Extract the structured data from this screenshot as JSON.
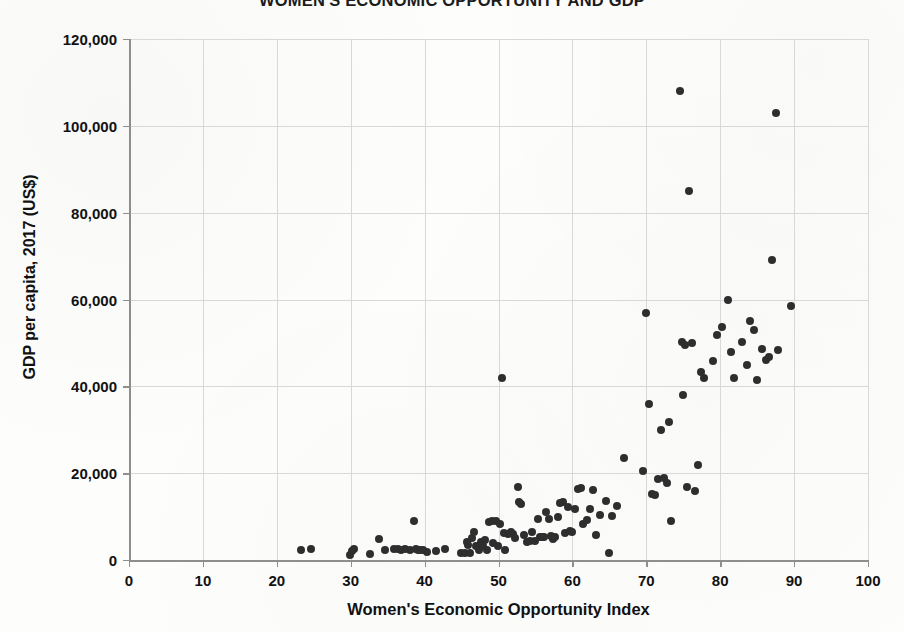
{
  "chart_data": {
    "type": "scatter",
    "title": "WOMEN'S ECONOMIC OPPORTUNITY AND GDP",
    "xlabel": "Women's Economic Opportunity Index",
    "ylabel": "GDP per capita, 2017 (US$)",
    "xlim": [
      0,
      100
    ],
    "ylim": [
      0,
      120000
    ],
    "xticks": [
      "0",
      "10",
      "20",
      "30",
      "40",
      "50",
      "60",
      "70",
      "80",
      "90",
      "100"
    ],
    "xtick_values": [
      0,
      10,
      20,
      30,
      40,
      50,
      60,
      70,
      80,
      90,
      100
    ],
    "yticks": [
      "0",
      "20,000",
      "40,000",
      "60,000",
      "80,000",
      "100,000",
      "120,000"
    ],
    "ytick_values": [
      0,
      20000,
      40000,
      60000,
      80000,
      100000,
      120000
    ],
    "grid": "both",
    "legend": "none",
    "marker_color": "#2e2e2e",
    "marker_size_px": 8,
    "gridline_color": "#d8d8d8",
    "axis_color": "#8e8e8e",
    "background_color": "#fdfdfc",
    "points": [
      [
        23.3,
        2300
      ],
      [
        24.6,
        2500
      ],
      [
        29.9,
        1200
      ],
      [
        30.2,
        2000
      ],
      [
        30.4,
        2600
      ],
      [
        32.6,
        1300
      ],
      [
        33.8,
        4800
      ],
      [
        34.6,
        2300
      ],
      [
        35.8,
        2500
      ],
      [
        36.4,
        2600
      ],
      [
        36.8,
        2400
      ],
      [
        37.4,
        2500
      ],
      [
        38.0,
        2200
      ],
      [
        38.6,
        9000
      ],
      [
        38.9,
        2600
      ],
      [
        39.1,
        2300
      ],
      [
        39.4,
        2200
      ],
      [
        39.8,
        2400
      ],
      [
        40.3,
        1800
      ],
      [
        41.5,
        2100
      ],
      [
        42.8,
        2600
      ],
      [
        44.9,
        1500
      ],
      [
        45.4,
        1600
      ],
      [
        45.7,
        4200
      ],
      [
        45.9,
        3400
      ],
      [
        46.2,
        1700
      ],
      [
        46.4,
        5000
      ],
      [
        46.7,
        6500
      ],
      [
        46.9,
        3300
      ],
      [
        47.3,
        2200
      ],
      [
        47.6,
        4100
      ],
      [
        47.9,
        3300
      ],
      [
        48.2,
        4500
      ],
      [
        48.4,
        2400
      ],
      [
        48.7,
        8700
      ],
      [
        49.1,
        9000
      ],
      [
        49.3,
        4000
      ],
      [
        49.6,
        8900
      ],
      [
        49.9,
        3300
      ],
      [
        50.2,
        8300
      ],
      [
        50.5,
        42000
      ],
      [
        50.7,
        6200
      ],
      [
        50.9,
        2400
      ],
      [
        51.3,
        5900
      ],
      [
        51.7,
        6500
      ],
      [
        52.0,
        6100
      ],
      [
        52.3,
        5100
      ],
      [
        52.6,
        16700
      ],
      [
        52.8,
        13300
      ],
      [
        53.1,
        12900
      ],
      [
        53.4,
        5800
      ],
      [
        53.8,
        4200
      ],
      [
        54.2,
        4400
      ],
      [
        54.6,
        6500
      ],
      [
        55.0,
        4300
      ],
      [
        55.3,
        9400
      ],
      [
        55.6,
        5300
      ],
      [
        55.9,
        5200
      ],
      [
        56.1,
        5300
      ],
      [
        56.4,
        11000
      ],
      [
        56.8,
        9400
      ],
      [
        57.1,
        5500
      ],
      [
        57.4,
        4900
      ],
      [
        57.7,
        5300
      ],
      [
        58.0,
        10000
      ],
      [
        58.3,
        13100
      ],
      [
        58.7,
        13400
      ],
      [
        59.0,
        6300
      ],
      [
        59.4,
        12200
      ],
      [
        59.7,
        6600
      ],
      [
        60.0,
        6400
      ],
      [
        60.4,
        11800
      ],
      [
        60.8,
        16300
      ],
      [
        61.2,
        16600
      ],
      [
        61.5,
        8400
      ],
      [
        62.0,
        9200
      ],
      [
        62.4,
        11700
      ],
      [
        62.8,
        16200
      ],
      [
        63.2,
        5700
      ],
      [
        63.8,
        10400
      ],
      [
        64.5,
        13500
      ],
      [
        65.0,
        1500
      ],
      [
        65.4,
        10100
      ],
      [
        66.0,
        12400
      ],
      [
        67.0,
        23500
      ],
      [
        69.5,
        20600
      ],
      [
        70.0,
        56800
      ],
      [
        70.4,
        36000
      ],
      [
        70.8,
        15100
      ],
      [
        71.2,
        14900
      ],
      [
        71.6,
        18600
      ],
      [
        72.0,
        29900
      ],
      [
        72.4,
        18900
      ],
      [
        72.8,
        17700
      ],
      [
        73.1,
        31700
      ],
      [
        73.4,
        9000
      ],
      [
        74.5,
        108000
      ],
      [
        74.8,
        50300
      ],
      [
        75.0,
        38000
      ],
      [
        75.2,
        49500
      ],
      [
        75.5,
        16800
      ],
      [
        75.8,
        85000
      ],
      [
        76.2,
        50000
      ],
      [
        76.6,
        15800
      ],
      [
        77.0,
        21900
      ],
      [
        77.4,
        43400
      ],
      [
        77.8,
        42000
      ],
      [
        79.0,
        45800
      ],
      [
        79.6,
        51800
      ],
      [
        80.2,
        53600
      ],
      [
        81.0,
        59800
      ],
      [
        81.4,
        47800
      ],
      [
        81.8,
        41900
      ],
      [
        83.0,
        50300
      ],
      [
        83.6,
        44900
      ],
      [
        84.0,
        55100
      ],
      [
        84.6,
        53000
      ],
      [
        85.0,
        41500
      ],
      [
        85.6,
        48600
      ],
      [
        86.2,
        46000
      ],
      [
        86.6,
        46800
      ],
      [
        87.0,
        69100
      ],
      [
        87.6,
        103000
      ],
      [
        87.8,
        48300
      ],
      [
        89.6,
        58600
      ]
    ]
  }
}
